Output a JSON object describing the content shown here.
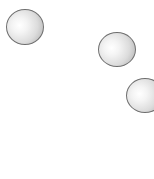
{
  "scene": {
    "width": 154,
    "height": 179,
    "background": "#ffffff",
    "balls": [
      {
        "name": "ball-1",
        "cx": 25,
        "cy": 27,
        "w": 38,
        "h": 36
      },
      {
        "name": "ball-2",
        "cx": 117,
        "cy": 49,
        "w": 38,
        "h": 35
      },
      {
        "name": "ball-3",
        "cx": 145,
        "cy": 95,
        "w": 38,
        "h": 35
      }
    ],
    "colors": {
      "outline": "#6f6f6f",
      "highlight": "#ffffff",
      "shade": "#9a9a9a"
    }
  }
}
